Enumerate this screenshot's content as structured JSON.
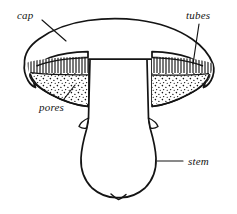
{
  "figure": {
    "kind": "line-drawing",
    "background_color": "#ffffff",
    "ink_color": "#141414"
  },
  "labels": [
    {
      "id": "cap",
      "text": "cap",
      "style": "italic-serif",
      "leader": "line from label to upper-left cap surface"
    },
    {
      "id": "tubes",
      "text": "tubes",
      "style": "italic-serif",
      "leader": "line from label down-left to hatched band under right cap"
    },
    {
      "id": "pores",
      "text": "pores",
      "style": "italic-serif",
      "leader": "line from label up-right to stippled band under left cap"
    },
    {
      "id": "stem",
      "text": "stem",
      "style": "italic-serif",
      "leader": "horizontal line from label left to stem outline"
    }
  ],
  "regions": [
    {
      "id": "cap-surface",
      "name": "cap",
      "fill": "none",
      "description": "broad rounded cap arching over the stem, edges curling down to points on both sides"
    },
    {
      "id": "tube-layer-left",
      "name": "tubes",
      "fill": "vertical-hatch",
      "description": "dense vertical line hatching on the upper part of the left underside wedge"
    },
    {
      "id": "tube-layer-right",
      "name": "tubes",
      "fill": "vertical-hatch",
      "description": "dense vertical line hatching on the upper part of the right underside wedge"
    },
    {
      "id": "pore-surface-left",
      "name": "pores",
      "fill": "stipple",
      "description": "stippled dotted band on the lower part of the left underside wedge"
    },
    {
      "id": "pore-surface-right",
      "name": "pores",
      "fill": "stipple",
      "description": "stippled dotted band on the lower part of the right underside wedge"
    },
    {
      "id": "stem-body",
      "name": "stem",
      "fill": "none",
      "description": "thick bulbous stalk widening toward a rounded base with a small notch at the bottom centre"
    }
  ]
}
